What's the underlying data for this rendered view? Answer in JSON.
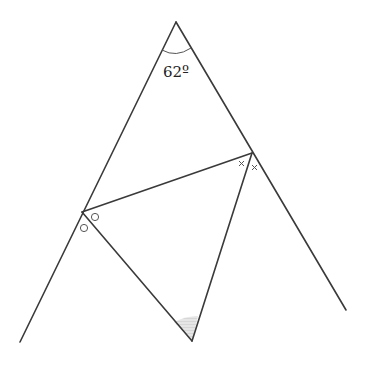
{
  "diagram": {
    "apex_angle_label": "62º",
    "points": {
      "apex": [
        176,
        22
      ],
      "left_end": [
        20,
        342
      ],
      "right_end": [
        346,
        310
      ],
      "P": [
        82,
        212
      ],
      "Q": [
        252,
        153
      ],
      "R": [
        192,
        341
      ]
    },
    "angle_marks": {
      "at_P": "circle",
      "at_Q": "cross",
      "at_R": "shaded"
    },
    "colors": {
      "line": "#3a3a3a",
      "shade": "#d6d6d6"
    }
  }
}
